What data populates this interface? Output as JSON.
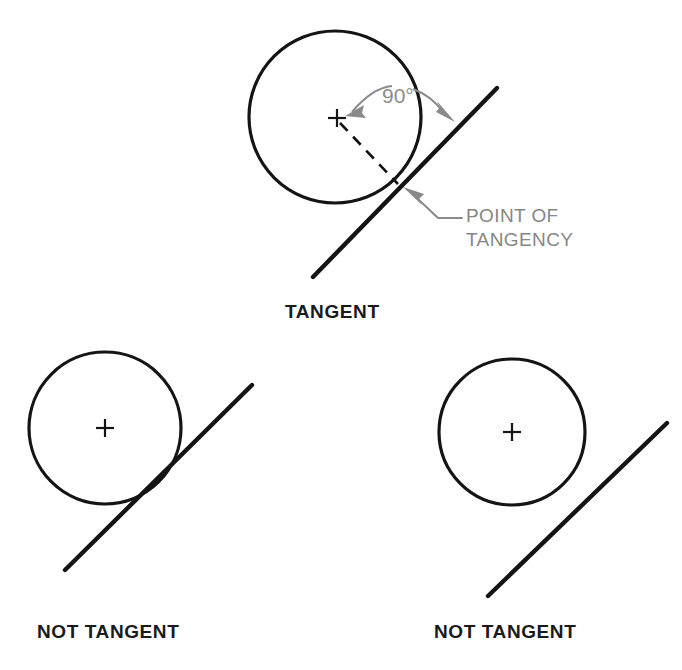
{
  "figure": {
    "title_omitted": true,
    "background_color": "#ffffff",
    "stroke_color": "#141414",
    "annotation_color": "#8a8a8a"
  },
  "panels": [
    {
      "id": "tangent",
      "caption": "TANGENT",
      "caption_x": 285,
      "caption_y": 318,
      "circle": {
        "cx": 335,
        "cy": 117,
        "r": 86
      },
      "center_mark": {
        "x": 337,
        "y": 118,
        "size": 9
      },
      "line": {
        "x1": 313,
        "y1": 277,
        "x2": 497,
        "y2": 88
      },
      "tangency_point": {
        "x": 400,
        "y": 186
      },
      "radius_dashed": {
        "x1": 340,
        "y1": 122,
        "x2": 398,
        "y2": 184
      },
      "annotations": [
        {
          "name": "angle-label",
          "text": "90°",
          "x": 382,
          "y": 103,
          "color": "#8d8d8d"
        },
        {
          "name": "point-of-tangency-label",
          "lines": [
            "POINT OF",
            "TANGENCY"
          ],
          "x": 465,
          "y": 222,
          "color": "#868686"
        }
      ]
    },
    {
      "id": "not-tangent-secant",
      "caption": "NOT TANGENT",
      "caption_x": 37,
      "caption_y": 638,
      "circle": {
        "cx": 105,
        "cy": 428,
        "r": 76
      },
      "center_mark": {
        "x": 105,
        "y": 428,
        "size": 9
      },
      "line": {
        "x1": 65,
        "y1": 570,
        "x2": 252,
        "y2": 385
      }
    },
    {
      "id": "not-tangent-separate",
      "caption": "NOT TANGENT",
      "caption_x": 434,
      "caption_y": 638,
      "circle": {
        "cx": 512,
        "cy": 432,
        "r": 73
      },
      "center_mark": {
        "x": 512,
        "y": 432,
        "size": 9
      },
      "line": {
        "x1": 488,
        "y1": 596,
        "x2": 667,
        "y2": 423
      }
    }
  ],
  "labels": {
    "tangent": "TANGENT",
    "not_tangent_left": "NOT TANGENT",
    "not_tangent_right": "NOT  TANGENT",
    "angle": "90°",
    "point_of_tangency_line1": "POINT OF",
    "point_of_tangency_line2": "TANGENCY"
  }
}
